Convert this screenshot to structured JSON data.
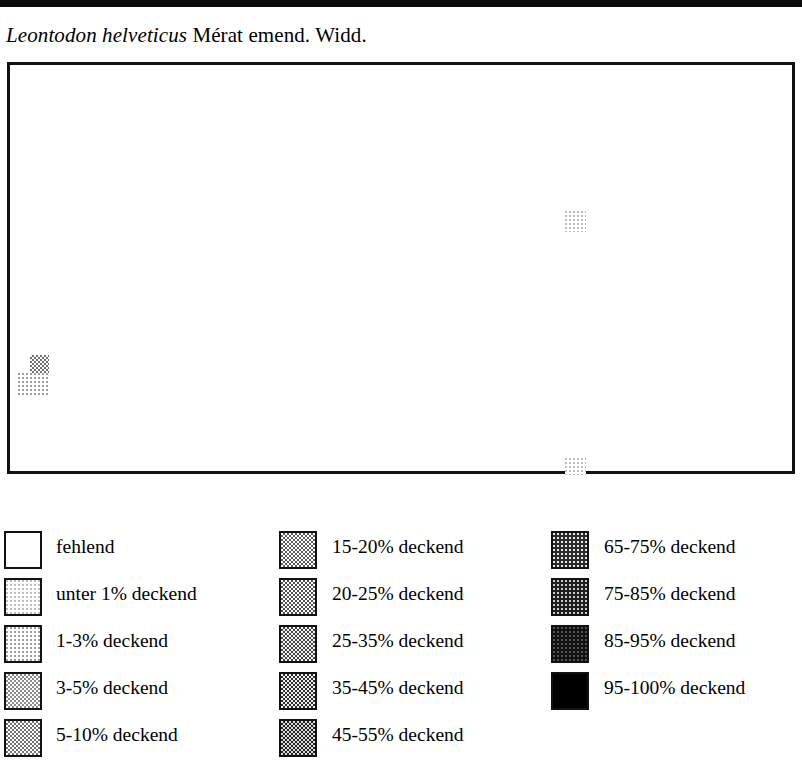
{
  "page": {
    "title_scientific": "Leontodon helveticus",
    "title_authority": " Mérat emend. Widd."
  },
  "map": {
    "name": "distribution-map",
    "frame_color": "#111111",
    "background": "#ffffff",
    "markers": [
      {
        "id": "marker-upper-left",
        "level": 4,
        "left": 20,
        "top": 290,
        "width": 19,
        "height": 21,
        "label": "5-10% deckend"
      },
      {
        "id": "marker-lower-left",
        "level": 2,
        "left": 8,
        "top": 308,
        "width": 31,
        "height": 22,
        "label": "1-3% deckend"
      },
      {
        "id": "marker-centre-east",
        "level": 1,
        "left": 555,
        "top": 146,
        "width": 21,
        "height": 21,
        "label": "unter 1% deckend"
      },
      {
        "id": "marker-south-east",
        "level": 1,
        "left": 555,
        "top": 393,
        "width": 21,
        "height": 17,
        "label": "unter 1% deckend"
      }
    ]
  },
  "legend": {
    "name": "coverage-legend",
    "columns": [
      {
        "name": "legend-column-1",
        "items": [
          {
            "label": "fehlend",
            "level": 0
          },
          {
            "label": "unter 1% deckend",
            "level": 1
          },
          {
            "label": "1-3% deckend",
            "level": 2
          },
          {
            "label": "3-5% deckend",
            "level": 3
          },
          {
            "label": "5-10% deckend",
            "level": 4
          }
        ]
      },
      {
        "name": "legend-column-2",
        "items": [
          {
            "label": "15-20% deckend",
            "level": 5
          },
          {
            "label": "20-25% deckend",
            "level": 6
          },
          {
            "label": "25-35% deckend",
            "level": 7
          },
          {
            "label": "35-45% deckend",
            "level": 8
          },
          {
            "label": "45-55% deckend",
            "level": 9
          }
        ]
      },
      {
        "name": "legend-column-3",
        "items": [
          {
            "label": "65-75% deckend",
            "level": 10
          },
          {
            "label": "75-85% deckend",
            "level": 11
          },
          {
            "label": "85-95% deckend",
            "level": 12
          },
          {
            "label": "95-100% deckend",
            "level": 13
          }
        ]
      }
    ]
  }
}
